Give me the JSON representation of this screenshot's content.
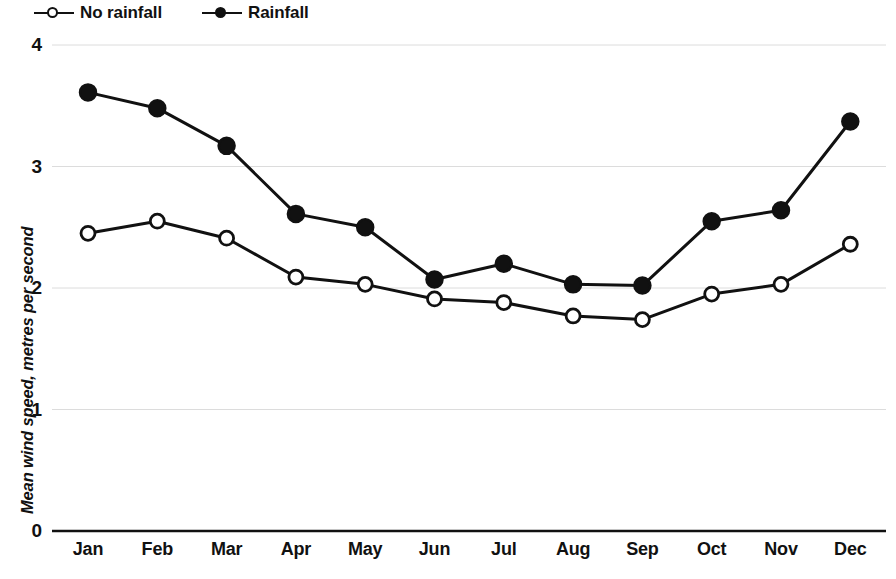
{
  "chart_data": {
    "type": "line",
    "title": "",
    "xlabel": "",
    "ylabel": "Mean wind speed, metres per second",
    "categories": [
      "Jan",
      "Feb",
      "Mar",
      "Apr",
      "May",
      "Jun",
      "Jul",
      "Aug",
      "Sep",
      "Oct",
      "Nov",
      "Dec"
    ],
    "series": [
      {
        "name": "No rainfall",
        "marker": "open-circle",
        "color": "#111111",
        "values": [
          2.45,
          2.55,
          2.41,
          2.09,
          2.03,
          1.91,
          1.88,
          1.77,
          1.74,
          1.95,
          2.03,
          2.36
        ]
      },
      {
        "name": "Rainfall",
        "marker": "filled-circle",
        "color": "#111111",
        "values": [
          3.61,
          3.48,
          3.17,
          2.61,
          2.5,
          2.07,
          2.2,
          2.03,
          2.02,
          2.55,
          2.64,
          3.37
        ]
      }
    ],
    "ylim": [
      0,
      4
    ],
    "yticks": [
      0,
      1,
      2,
      3,
      4
    ],
    "ytick_labels": [
      "0",
      "1",
      "2",
      "3",
      "4"
    ],
    "grid": true,
    "grid_color": "#dcdcdc",
    "legend_position": "top-left",
    "axis_color": "#111111"
  },
  "legend": {
    "entries": [
      {
        "label": "No rainfall",
        "marker": "open-circle"
      },
      {
        "label": "Rainfall",
        "marker": "filled-circle"
      }
    ]
  }
}
